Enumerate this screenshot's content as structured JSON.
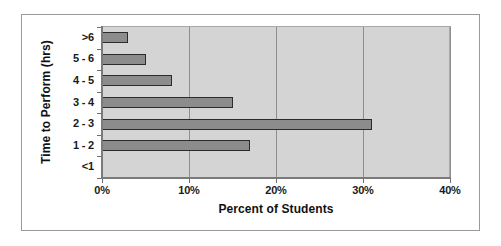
{
  "chart_data": {
    "type": "bar",
    "orientation": "horizontal",
    "title": "",
    "xlabel": "Percent of Students",
    "ylabel": "Time to Perform (hrs)",
    "categories": [
      "<1",
      "1 - 2",
      "2 - 3",
      "3 - 4",
      "4 - 5",
      "5 - 6",
      ">6"
    ],
    "values": [
      0,
      17,
      31,
      15,
      8,
      5,
      3
    ],
    "xlim": [
      0,
      40
    ],
    "xticks": [
      0,
      10,
      20,
      30,
      40
    ],
    "xtick_labels": [
      "0%",
      "10%",
      "20%",
      "30%",
      "40%"
    ],
    "ytick_labels": [
      ">6",
      "5 - 6",
      "4 - 5",
      "3 - 4",
      "2 - 3",
      "1 - 2",
      "<1"
    ],
    "grid": "vertical",
    "legend": "none",
    "colors": {
      "bar_fill": "#8c8c8c",
      "bar_border": "#2b2b2b",
      "plot_background": "#d4d4d4",
      "figure_background": "#ffffff",
      "gridline": "#8f8f8f",
      "axis": "#7a7a7a",
      "text": "#1a1a1a"
    },
    "series": [
      {
        "name": "Percent of Students",
        "values": [
          0,
          17,
          31,
          15,
          8,
          5,
          3
        ]
      }
    ],
    "points": [
      {
        "category": ">6",
        "value": 3
      },
      {
        "category": "5 - 6",
        "value": 5
      },
      {
        "category": "4 - 5",
        "value": 8
      },
      {
        "category": "3 - 4",
        "value": 15
      },
      {
        "category": "2 - 3",
        "value": 31
      },
      {
        "category": "1 - 2",
        "value": 17
      },
      {
        "category": "<1",
        "value": 0
      }
    ]
  }
}
